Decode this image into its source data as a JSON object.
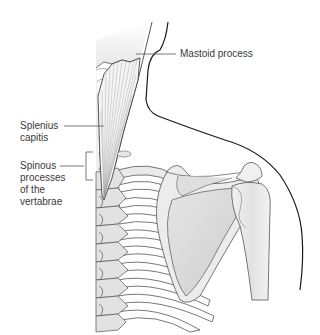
{
  "diagram": {
    "labels": {
      "mastoid": {
        "text": "Mastoid process"
      },
      "splenius": {
        "lines": [
          "Splenius",
          "capitis"
        ]
      },
      "spinous": {
        "lines": [
          "Spinous",
          "processes",
          "of the",
          "vertabrae"
        ]
      }
    },
    "colors": {
      "outline": "#1a1a1a",
      "bone_outline": "#555555",
      "bone_fill": "#ececec",
      "bone_shade": "#d8d8d8",
      "scapula_fill": "#dcdcdc",
      "muscle_fill": "#f4f4f4",
      "muscle_fibers": "#9a9a9a",
      "leader_line": "#555555",
      "label_text": "#3a3a3a"
    }
  }
}
